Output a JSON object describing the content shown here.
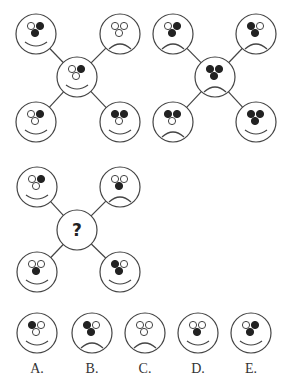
{
  "puzzle": {
    "colors": {
      "stroke": "#444444",
      "fill": "#222222",
      "background": "#ffffff"
    },
    "figures": [
      {
        "id": "figure-1",
        "center": [
          77,
          77
        ],
        "faces": [
          {
            "pos": "top-left",
            "cx": 36,
            "cy": 34,
            "eyes": [
              "empty",
              "filled"
            ],
            "nose": "filled",
            "mouth": "smile"
          },
          {
            "pos": "top-right",
            "cx": 120,
            "cy": 34,
            "eyes": [
              "empty",
              "empty"
            ],
            "nose": "empty",
            "mouth": "frown"
          },
          {
            "pos": "center",
            "cx": 77,
            "cy": 77,
            "eyes": [
              "empty",
              "filled"
            ],
            "nose": "empty",
            "mouth": "smile"
          },
          {
            "pos": "bottom-left",
            "cx": 36,
            "cy": 122,
            "eyes": [
              "empty",
              "filled"
            ],
            "nose": "empty",
            "mouth": "smile"
          },
          {
            "pos": "bottom-right",
            "cx": 120,
            "cy": 122,
            "eyes": [
              "filled",
              "filled"
            ],
            "nose": "empty",
            "mouth": "smile"
          }
        ]
      },
      {
        "id": "figure-2",
        "center": [
          215,
          77
        ],
        "faces": [
          {
            "pos": "top-left",
            "cx": 173,
            "cy": 34,
            "eyes": [
              "empty",
              "filled"
            ],
            "nose": "filled",
            "mouth": "frown"
          },
          {
            "pos": "top-right",
            "cx": 256,
            "cy": 34,
            "eyes": [
              "filled",
              "empty"
            ],
            "nose": "filled",
            "mouth": "frown"
          },
          {
            "pos": "center",
            "cx": 215,
            "cy": 77,
            "eyes": [
              "filled",
              "filled"
            ],
            "nose": "filled",
            "mouth": "frown"
          },
          {
            "pos": "bottom-left",
            "cx": 173,
            "cy": 122,
            "eyes": [
              "filled",
              "filled"
            ],
            "nose": "empty",
            "mouth": "frown"
          },
          {
            "pos": "bottom-right",
            "cx": 256,
            "cy": 122,
            "eyes": [
              "filled",
              "filled"
            ],
            "nose": "filled",
            "mouth": "smile"
          }
        ]
      },
      {
        "id": "figure-3",
        "center": [
          77,
          230
        ],
        "question_mark": "?",
        "faces": [
          {
            "pos": "top-left",
            "cx": 37,
            "cy": 187,
            "eyes": [
              "empty",
              "filled"
            ],
            "nose": "empty",
            "mouth": "smile"
          },
          {
            "pos": "top-right",
            "cx": 120,
            "cy": 187,
            "eyes": [
              "empty",
              "empty"
            ],
            "nose": "filled",
            "mouth": "frown"
          },
          {
            "pos": "bottom-left",
            "cx": 37,
            "cy": 272,
            "eyes": [
              "empty",
              "empty"
            ],
            "nose": "filled",
            "mouth": "smile"
          },
          {
            "pos": "bottom-right",
            "cx": 120,
            "cy": 272,
            "eyes": [
              "filled",
              "empty"
            ],
            "nose": "filled",
            "mouth": "smile"
          }
        ]
      }
    ],
    "options": [
      {
        "label": "A.",
        "cx": 37,
        "cy": 333,
        "eyes": [
          "filled",
          "empty"
        ],
        "nose": "empty",
        "mouth": "smile"
      },
      {
        "label": "B.",
        "cx": 92,
        "cy": 333,
        "eyes": [
          "filled",
          "empty"
        ],
        "nose": "filled",
        "mouth": "frown"
      },
      {
        "label": "C.",
        "cx": 145,
        "cy": 333,
        "eyes": [
          "empty",
          "empty"
        ],
        "nose": "empty",
        "mouth": "frown"
      },
      {
        "label": "D.",
        "cx": 198,
        "cy": 333,
        "eyes": [
          "empty",
          "empty"
        ],
        "nose": "filled",
        "mouth": "smile"
      },
      {
        "label": "E.",
        "cx": 251,
        "cy": 333,
        "eyes": [
          "empty",
          "filled"
        ],
        "nose": "filled",
        "mouth": "smile"
      }
    ]
  }
}
